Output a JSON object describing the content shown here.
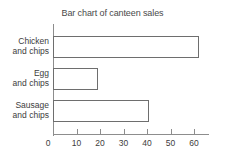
{
  "chart_data": {
    "type": "bar",
    "orientation": "horizontal",
    "title": "Bar chart of canteen sales",
    "xlabel": "",
    "ylabel": "",
    "categories": [
      "Chicken and chips",
      "Egg and chips",
      "Sausage and chips"
    ],
    "values": [
      62,
      19,
      41
    ],
    "xlim": [
      0,
      66
    ],
    "xticks": [
      0,
      10,
      20,
      30,
      40,
      50,
      60
    ],
    "xtick_labels": [
      "0",
      "10",
      "20",
      "30",
      "40",
      "50",
      "60"
    ],
    "grid": false,
    "legend": null,
    "bar_fill": "#ffffff",
    "bar_stroke": "#6e6e6e",
    "axis_color": "#8d8d8d",
    "text_color": "#3d3d3d",
    "background": "#ffffff"
  },
  "category_lines": [
    {
      "l1": "Chicken",
      "l2": "and chips"
    },
    {
      "l1": "Egg",
      "l2": "and chips"
    },
    {
      "l1": "Sausage",
      "l2": "and chips"
    }
  ]
}
